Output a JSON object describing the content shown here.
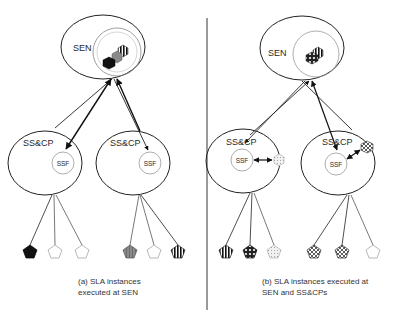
{
  "diagram": {
    "panels": [
      {
        "id": "a",
        "caption_line1": "(a) SLA instances",
        "caption_line2": "executed at SEN",
        "sen_label": "SEN",
        "sscp_labels": [
          "SS&CP",
          "SS&CP"
        ],
        "ssf_labels": [
          "SSF",
          "SSF"
        ],
        "sen_instances": [
          "black-hexagon",
          "gray-hexagon",
          "striped-hexagon"
        ],
        "sscp_instances": [],
        "leaves_left": [
          "black",
          "white",
          "white"
        ],
        "leaves_right": [
          "gray",
          "white",
          "striped"
        ]
      },
      {
        "id": "b",
        "caption_line1": "(b) SLA instances executed at",
        "caption_line2": "SEN and SS&CPs",
        "sen_label": "SEN",
        "sscp_labels": [
          "SS&CP",
          "SS&CP"
        ],
        "ssf_labels": [
          "SSF",
          "SSF"
        ],
        "sen_instances": [
          "checkered-hexagon",
          "striped-hexagon"
        ],
        "sscp_instances": [
          "dotted-hexagon",
          "checkered-hexagon"
        ],
        "leaves_left": [
          "striped",
          "dark-checkered",
          "white-dotted"
        ],
        "leaves_right": [
          "checkered",
          "checkered",
          "white"
        ]
      }
    ]
  }
}
